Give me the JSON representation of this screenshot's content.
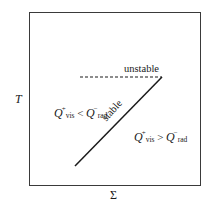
{
  "diagram": {
    "axes": {
      "y_label": "T",
      "x_label": "Σ"
    },
    "curves": [
      {
        "name": "unstable branch",
        "style": "dashed",
        "label": "unstable"
      },
      {
        "name": "stable branch",
        "style": "solid",
        "label": "stable"
      }
    ],
    "regions": {
      "left": {
        "q1": "Q",
        "sup1": "+",
        "sub1": "vis",
        "op": "<",
        "q2": "Q",
        "sup2": "−",
        "sub2": "rad"
      },
      "right": {
        "q1": "Q",
        "sup1": "+",
        "sub1": "vis",
        "op": ">",
        "q2": "Q",
        "sup2": "−",
        "sub2": "rad"
      }
    },
    "colors": {
      "line": "#1a1a1a",
      "frame": "#3a3a3a",
      "background": "#ffffff"
    }
  }
}
